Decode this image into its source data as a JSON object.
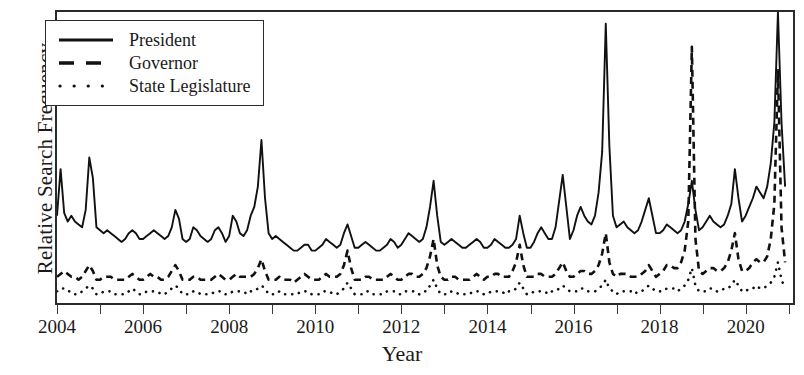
{
  "axes": {
    "ylabel": "Relative Search Frequency",
    "xlabel": "Year",
    "xticks_major": [
      "2004",
      "2006",
      "2008",
      "2010",
      "2012",
      "2014",
      "2016",
      "2018",
      "2020"
    ],
    "xlim": [
      2004,
      2021.1
    ],
    "ylim": [
      0,
      100
    ],
    "grid": false
  },
  "legend": {
    "position": "upper-left-inside",
    "entries": [
      {
        "label": "President",
        "style": "solid"
      },
      {
        "label": "Governor",
        "style": "dashed"
      },
      {
        "label": "State Legislature",
        "style": "dotted"
      }
    ]
  },
  "chart_data": {
    "type": "line",
    "title": "",
    "xlabel": "Year",
    "ylabel": "Relative Search Frequency",
    "xlim": [
      2004,
      2021.1
    ],
    "ylim": [
      0,
      100
    ],
    "grid": false,
    "legend_position": "upper-left-inside",
    "x_start": 2004.0,
    "x_step": 0.0833333,
    "x_note": "monthly samples, Jan 2004 through Dec 2020",
    "series": [
      {
        "name": "President",
        "style": "solid",
        "color": "#111111",
        "values": [
          30,
          46,
          31,
          28,
          30,
          28,
          27,
          26,
          32,
          50,
          43,
          26,
          25,
          24,
          25,
          24,
          23,
          22,
          21,
          22,
          24,
          25,
          24,
          22,
          22,
          23,
          24,
          25,
          24,
          23,
          22,
          23,
          26,
          32,
          29,
          22,
          21,
          22,
          26,
          25,
          23,
          22,
          21,
          22,
          25,
          26,
          24,
          21,
          23,
          30,
          28,
          24,
          23,
          25,
          30,
          33,
          40,
          56,
          36,
          24,
          22,
          23,
          22,
          21,
          20,
          19,
          18,
          18,
          19,
          20,
          20,
          18,
          18,
          19,
          20,
          22,
          21,
          20,
          19,
          20,
          24,
          27,
          23,
          19,
          19,
          20,
          21,
          20,
          19,
          18,
          18,
          19,
          20,
          22,
          21,
          19,
          20,
          22,
          24,
          23,
          22,
          21,
          22,
          26,
          33,
          42,
          30,
          21,
          20,
          21,
          22,
          21,
          20,
          19,
          19,
          20,
          21,
          22,
          21,
          19,
          19,
          20,
          22,
          21,
          20,
          19,
          19,
          20,
          22,
          30,
          24,
          19,
          19,
          21,
          24,
          26,
          24,
          22,
          22,
          26,
          35,
          44,
          33,
          22,
          25,
          30,
          33,
          30,
          28,
          27,
          30,
          38,
          52,
          96,
          54,
          30,
          26,
          27,
          28,
          26,
          25,
          24,
          25,
          28,
          32,
          36,
          30,
          24,
          24,
          25,
          27,
          26,
          25,
          24,
          25,
          28,
          34,
          42,
          32,
          25,
          26,
          28,
          30,
          28,
          27,
          26,
          27,
          30,
          34,
          46,
          36,
          28,
          30,
          33,
          36,
          40,
          38,
          36,
          40,
          48,
          62,
          100,
          62,
          40
        ]
      },
      {
        "name": "Governor",
        "style": "dashed",
        "color": "#111111",
        "values": [
          9,
          10,
          11,
          10,
          9,
          9,
          8,
          9,
          11,
          13,
          11,
          8,
          8,
          9,
          9,
          9,
          8,
          8,
          8,
          8,
          9,
          10,
          9,
          8,
          8,
          9,
          10,
          9,
          9,
          8,
          8,
          9,
          11,
          13,
          11,
          8,
          8,
          8,
          9,
          9,
          8,
          8,
          8,
          8,
          9,
          10,
          9,
          8,
          8,
          9,
          10,
          9,
          9,
          9,
          9,
          10,
          12,
          15,
          11,
          8,
          8,
          8,
          9,
          8,
          8,
          8,
          7,
          8,
          9,
          10,
          9,
          8,
          8,
          8,
          9,
          10,
          9,
          9,
          9,
          10,
          13,
          18,
          12,
          8,
          8,
          8,
          9,
          9,
          8,
          8,
          8,
          8,
          9,
          10,
          9,
          8,
          8,
          9,
          10,
          10,
          9,
          9,
          10,
          12,
          16,
          22,
          13,
          9,
          8,
          8,
          9,
          9,
          8,
          8,
          8,
          8,
          9,
          10,
          9,
          8,
          9,
          9,
          10,
          10,
          9,
          9,
          9,
          11,
          14,
          20,
          13,
          9,
          9,
          9,
          10,
          10,
          9,
          9,
          9,
          10,
          12,
          14,
          11,
          9,
          9,
          10,
          11,
          11,
          10,
          10,
          11,
          13,
          17,
          24,
          14,
          10,
          9,
          10,
          10,
          10,
          9,
          9,
          9,
          10,
          11,
          13,
          11,
          9,
          10,
          11,
          13,
          13,
          12,
          12,
          14,
          18,
          28,
          88,
          22,
          11,
          10,
          11,
          12,
          12,
          11,
          11,
          12,
          14,
          18,
          24,
          15,
          11,
          11,
          12,
          14,
          15,
          14,
          14,
          16,
          22,
          34,
          80,
          26,
          14
        ]
      },
      {
        "name": "State Legislature",
        "style": "dotted",
        "color": "#111111",
        "values": [
          4,
          5,
          5,
          4,
          4,
          3,
          3,
          4,
          5,
          6,
          5,
          3,
          3,
          4,
          4,
          4,
          3,
          3,
          3,
          3,
          4,
          5,
          4,
          3,
          3,
          4,
          4,
          4,
          4,
          3,
          3,
          4,
          5,
          6,
          5,
          3,
          3,
          3,
          4,
          4,
          3,
          3,
          3,
          3,
          4,
          4,
          4,
          3,
          3,
          4,
          4,
          4,
          4,
          3,
          4,
          4,
          5,
          6,
          5,
          3,
          3,
          3,
          4,
          3,
          3,
          3,
          3,
          3,
          4,
          4,
          4,
          3,
          3,
          3,
          4,
          4,
          4,
          3,
          3,
          4,
          5,
          7,
          5,
          3,
          3,
          3,
          4,
          4,
          3,
          3,
          3,
          3,
          4,
          4,
          4,
          3,
          3,
          4,
          4,
          4,
          4,
          3,
          4,
          4,
          6,
          8,
          5,
          3,
          3,
          3,
          4,
          4,
          3,
          3,
          3,
          3,
          4,
          4,
          4,
          3,
          3,
          4,
          4,
          4,
          4,
          3,
          4,
          4,
          5,
          7,
          5,
          3,
          3,
          4,
          4,
          4,
          4,
          3,
          4,
          4,
          5,
          6,
          5,
          4,
          4,
          4,
          5,
          5,
          4,
          4,
          4,
          5,
          6,
          8,
          5,
          4,
          3,
          4,
          4,
          4,
          4,
          3,
          4,
          4,
          5,
          6,
          5,
          4,
          4,
          4,
          5,
          5,
          5,
          4,
          5,
          6,
          8,
          12,
          6,
          4,
          4,
          4,
          5,
          5,
          4,
          4,
          5,
          5,
          6,
          8,
          6,
          4,
          4,
          5,
          5,
          6,
          5,
          5,
          6,
          7,
          9,
          14,
          8,
          5
        ]
      }
    ]
  }
}
